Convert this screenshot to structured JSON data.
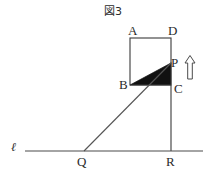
{
  "figure": {
    "title": "図3",
    "background_color": "#ffffff",
    "stroke_color": "#3a3a3a",
    "fill_color": "#111111",
    "labels": {
      "A": "A",
      "B": "B",
      "C": "C",
      "D": "D",
      "P": "P",
      "Q": "Q",
      "R": "R",
      "line_l": "ℓ"
    },
    "geometry": {
      "rectangle_ABCD": {
        "A": [
          130,
          38
        ],
        "B": [
          130,
          85
        ],
        "C": [
          171,
          85
        ],
        "D": [
          171,
          38
        ]
      },
      "point_P": [
        171,
        63
      ],
      "point_Q": [
        84,
        151
      ],
      "point_R": [
        171,
        151
      ],
      "shaded_triangle_BCP": [
        [
          130,
          85
        ],
        [
          171,
          85
        ],
        [
          171,
          63
        ]
      ],
      "line_l_segment": [
        [
          25,
          151
        ],
        [
          203,
          151
        ]
      ],
      "segment_QP": [
        [
          84,
          151
        ],
        [
          171,
          63
        ]
      ],
      "segment_CR": [
        [
          171,
          85
        ],
        [
          171,
          151
        ]
      ],
      "arrow_up": {
        "x": 190,
        "tip_y": 56,
        "tail_y": 79,
        "direction": "up"
      }
    },
    "icons": {
      "arrow": "arrow-up-icon"
    }
  }
}
